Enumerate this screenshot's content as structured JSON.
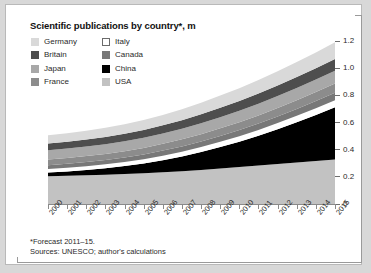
{
  "chart_card": {
    "title": "Scientific publications by country*, m"
  },
  "legend": {
    "columns": [
      {
        "items": [
          {
            "label": "Germany",
            "color": "#d9d9d9",
            "border": "#d9d9d9"
          },
          {
            "label": "Britain",
            "color": "#4e4e4e",
            "border": "#4e4e4e"
          },
          {
            "label": "Japan",
            "color": "#a8a8a8",
            "border": "#a8a8a8"
          },
          {
            "label": "France",
            "color": "#8c8c8c",
            "border": "#8c8c8c"
          }
        ]
      },
      {
        "items": [
          {
            "label": "Italy",
            "color": "#ffffff",
            "border": "#6b6b6b"
          },
          {
            "label": "Canada",
            "color": "#787878",
            "border": "#787878"
          },
          {
            "label": "China",
            "color": "#000000",
            "border": "#000000"
          },
          {
            "label": "USA",
            "color": "#c2c2c2",
            "border": "#c2c2c2"
          }
        ]
      }
    ]
  },
  "footnotes": [
    "*Forecast 2011–15.",
    "Sources: UNESCO; author's calculations"
  ],
  "chart_data": {
    "type": "area",
    "stacked": true,
    "title": "Scientific publications by country*, m",
    "xlabel": "",
    "ylabel": "",
    "units": "millions",
    "grid": false,
    "legend_position": "top-left",
    "ylim": [
      0,
      1.2
    ],
    "yticks": [
      "0",
      "0.2",
      "0.4",
      "0.6",
      "0.8",
      "1.0",
      "1.2"
    ],
    "ytick_values": [
      0,
      0.2,
      0.4,
      0.6,
      0.8,
      1.0,
      1.2
    ],
    "x": [
      2000,
      2001,
      2002,
      2003,
      2004,
      2005,
      2006,
      2007,
      2008,
      2009,
      2010,
      2011,
      2012,
      2013,
      2014,
      2015
    ],
    "categories": [
      "2000",
      "2001",
      "2002",
      "2003",
      "2004",
      "2005",
      "2006",
      "2007",
      "2008",
      "2009",
      "2010",
      "2011",
      "2012",
      "2013",
      "2014",
      "2015"
    ],
    "stack_order_bottom_to_top": [
      "USA",
      "China",
      "Italy",
      "Canada",
      "France",
      "Japan",
      "Britain",
      "Germany"
    ],
    "series": [
      {
        "name": "USA",
        "color": "#c2c2c2",
        "values": [
          0.205,
          0.208,
          0.212,
          0.216,
          0.221,
          0.227,
          0.234,
          0.242,
          0.251,
          0.262,
          0.272,
          0.283,
          0.295,
          0.306,
          0.317,
          0.328
        ]
      },
      {
        "name": "China",
        "color": "#000000",
        "values": [
          0.026,
          0.031,
          0.038,
          0.047,
          0.058,
          0.072,
          0.089,
          0.108,
          0.131,
          0.157,
          0.186,
          0.219,
          0.256,
          0.296,
          0.339,
          0.385
        ]
      },
      {
        "name": "Italy",
        "color": "#ffffff",
        "values": [
          0.026,
          0.027,
          0.028,
          0.029,
          0.03,
          0.031,
          0.033,
          0.035,
          0.037,
          0.039,
          0.041,
          0.043,
          0.045,
          0.047,
          0.049,
          0.051
        ]
      },
      {
        "name": "Canada",
        "color": "#787878",
        "values": [
          0.029,
          0.03,
          0.031,
          0.032,
          0.033,
          0.035,
          0.037,
          0.039,
          0.041,
          0.043,
          0.045,
          0.047,
          0.049,
          0.051,
          0.053,
          0.055
        ]
      },
      {
        "name": "France",
        "color": "#8c8c8c",
        "values": [
          0.042,
          0.043,
          0.044,
          0.045,
          0.047,
          0.048,
          0.05,
          0.052,
          0.054,
          0.056,
          0.058,
          0.06,
          0.062,
          0.064,
          0.066,
          0.068
        ]
      },
      {
        "name": "Japan",
        "color": "#a8a8a8",
        "values": [
          0.068,
          0.069,
          0.07,
          0.071,
          0.073,
          0.074,
          0.076,
          0.078,
          0.08,
          0.082,
          0.084,
          0.086,
          0.088,
          0.09,
          0.092,
          0.094
        ]
      },
      {
        "name": "Britain",
        "color": "#4e4e4e",
        "values": [
          0.05,
          0.051,
          0.052,
          0.054,
          0.056,
          0.058,
          0.06,
          0.063,
          0.066,
          0.069,
          0.072,
          0.075,
          0.078,
          0.081,
          0.084,
          0.087
        ]
      },
      {
        "name": "Germany",
        "color": "#d9d9d9",
        "values": [
          0.06,
          0.062,
          0.064,
          0.067,
          0.07,
          0.073,
          0.077,
          0.081,
          0.085,
          0.09,
          0.095,
          0.1,
          0.105,
          0.11,
          0.116,
          0.122
        ]
      }
    ]
  }
}
